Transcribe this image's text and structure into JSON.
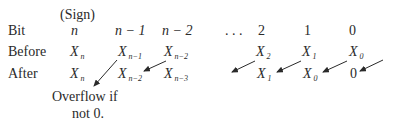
{
  "header": {
    "sign_label": "(Sign)"
  },
  "rows": {
    "bit": {
      "label": "Bit",
      "cells": [
        "n",
        "n − 1",
        "n − 2",
        ". . .",
        "2",
        "1",
        "0"
      ]
    },
    "before": {
      "label": "Before",
      "cells": [
        {
          "base": "X",
          "sub": "n"
        },
        {
          "base": "X",
          "sub": "n−1"
        },
        {
          "base": "X",
          "sub": "n−2"
        },
        {
          "base": "X",
          "sub": "2"
        },
        {
          "base": "X",
          "sub": "1"
        },
        {
          "base": "X",
          "sub": "0"
        }
      ]
    },
    "after": {
      "label": "After",
      "cells": [
        {
          "base": "X",
          "sub": "n"
        },
        {
          "base": "X",
          "sub": "n−2"
        },
        {
          "base": "X",
          "sub": "n−3"
        },
        {
          "base": "X",
          "sub": "1"
        },
        {
          "base": "X",
          "sub": "0"
        },
        {
          "base": "",
          "sub": "",
          "value": "0"
        }
      ]
    }
  },
  "note": {
    "line1": "Overflow if",
    "line2": "not 0."
  },
  "arrow_color": "#2a2a2a"
}
